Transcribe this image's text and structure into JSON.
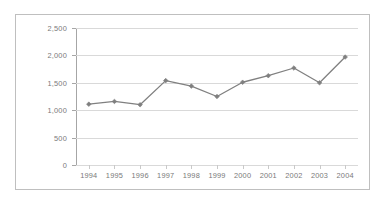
{
  "chart_data": {
    "type": "line",
    "title": "",
    "subtitle": "",
    "xlabel": "",
    "ylabel": "",
    "categories": [
      "1994",
      "1995",
      "1996",
      "1997",
      "1998",
      "1999",
      "2000",
      "2001",
      "2002",
      "2003",
      "2004"
    ],
    "values": [
      1110,
      1160,
      1100,
      1540,
      1440,
      1250,
      1510,
      1630,
      1770,
      1500,
      1970
    ],
    "series": [
      {
        "name": "",
        "values": [
          1110,
          1160,
          1100,
          1540,
          1440,
          1250,
          1510,
          1630,
          1770,
          1500,
          1970
        ]
      }
    ],
    "ylim": [
      0,
      2500
    ],
    "ytick_values": [
      0,
      500,
      1000,
      1500,
      2000,
      2500
    ],
    "ytick_labels": [
      "0",
      "500",
      "1,000",
      "1,500",
      "2,000",
      "2,500"
    ],
    "xtick_labels": [
      "1994",
      "1995",
      "1996",
      "1997",
      "1998",
      "1999",
      "2000",
      "2001",
      "2002",
      "2003",
      "2004"
    ],
    "grid": "horizontal",
    "legend": "none",
    "marker": "diamond",
    "line_color": "#808080",
    "marker_color": "#7f7f7f",
    "gridline_color": "#d9d9d9",
    "axis_color": "#a6a6a6",
    "tick_label_color": "#7a7a7a",
    "plot_background": "#ffffff",
    "frame_border_color": "#bfbfbf"
  }
}
